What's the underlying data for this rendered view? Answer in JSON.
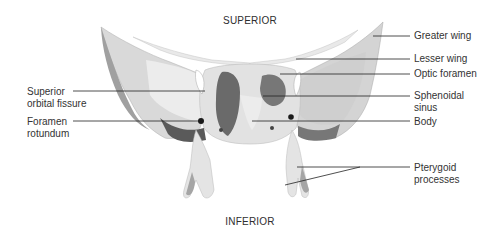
{
  "figure": {
    "orientation": {
      "top": "SUPERIOR",
      "bottom": "INFERIOR"
    },
    "labels_left": [
      {
        "id": "superior-orbital-fissure",
        "lines": [
          "Superior",
          "orbital fissure"
        ]
      },
      {
        "id": "foramen-rotundum",
        "lines": [
          "Foramen",
          "rotundum"
        ]
      }
    ],
    "labels_right": [
      {
        "id": "greater-wing",
        "lines": [
          "Greater wing"
        ]
      },
      {
        "id": "lesser-wing",
        "lines": [
          "Lesser wing"
        ]
      },
      {
        "id": "optic-foramen",
        "lines": [
          "Optic foramen"
        ]
      },
      {
        "id": "sphenoidal-sinus",
        "lines": [
          "Sphenoidal",
          "sinus"
        ]
      },
      {
        "id": "body",
        "lines": [
          "Body"
        ]
      },
      {
        "id": "pterygoid-processes",
        "lines": [
          "Pterygoid",
          "processes"
        ]
      }
    ],
    "colors": {
      "bone_light": "#e6e6e6",
      "bone_mid": "#c9c9c9",
      "bone_shadow": "#8f8f8f",
      "bone_dark": "#5c5c5c",
      "leader_line": "#222222",
      "text": "#333333"
    }
  }
}
